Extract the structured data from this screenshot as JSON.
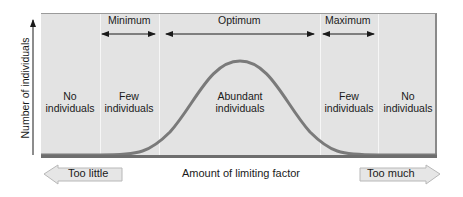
{
  "diagram": {
    "y_axis_label": "Number of individuals",
    "x_axis_label": "Amount of limiting factor",
    "left_arrow_label": "Too little",
    "right_arrow_label": "Too much",
    "ranges": [
      {
        "label": "Minimum"
      },
      {
        "label": "Optimum"
      },
      {
        "label": "Maximum"
      }
    ],
    "zones": [
      {
        "line1": "No",
        "line2": "individuals"
      },
      {
        "line1": "Few",
        "line2": "individuals"
      },
      {
        "line1": "Abundant",
        "line2": "individuals"
      },
      {
        "line1": "Few",
        "line2": "individuals"
      },
      {
        "line1": "No",
        "line2": "individuals"
      }
    ],
    "colors": {
      "panel": "#e3e3e3",
      "curve": "#7a7a7a",
      "arrow_fill": "#e6e6e6",
      "text": "#1a1a1a"
    }
  }
}
